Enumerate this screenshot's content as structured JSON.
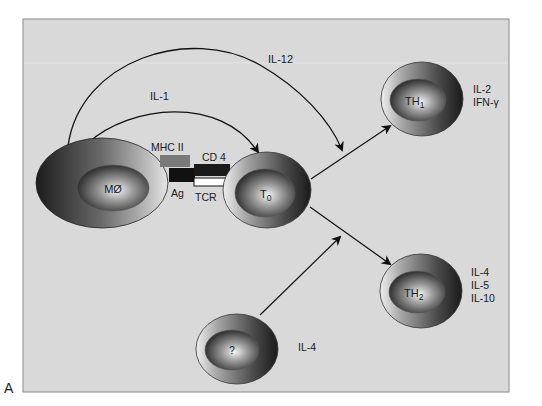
{
  "figure": {
    "panel_letter": "A",
    "background_color": "#d9d9d9"
  },
  "cells": {
    "macrophage": {
      "label": "MØ"
    },
    "t0": {
      "label": "T",
      "sub": "0"
    },
    "th1": {
      "label": "TH",
      "sub": "1",
      "cytokines": [
        "IL-2",
        "IFN-γ"
      ]
    },
    "th2": {
      "label": "TH",
      "sub": "2",
      "cytokines": [
        "IL-4",
        "IL-5",
        "IL-10"
      ]
    },
    "unknown": {
      "label": "?",
      "cytokine": "IL-4"
    }
  },
  "molecules": {
    "mhc2": "MHC II",
    "cd4": "CD 4",
    "ag": "Ag",
    "tcr": "TCR"
  },
  "arrows": {
    "il1": "IL-1",
    "il12": "IL-12"
  }
}
